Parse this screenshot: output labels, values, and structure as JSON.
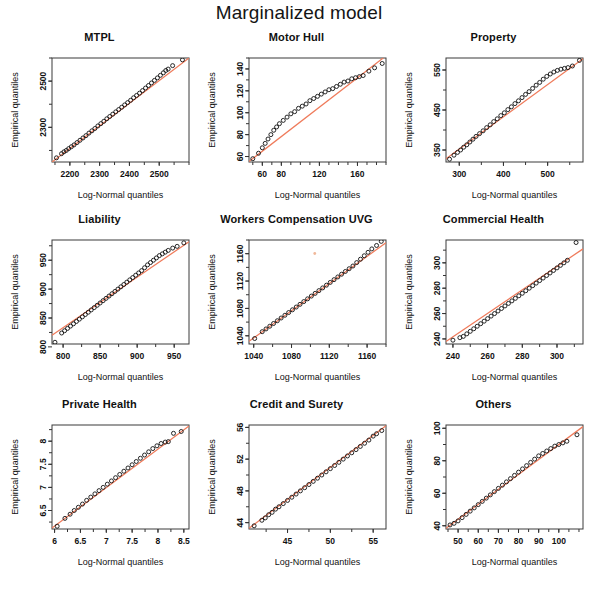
{
  "figure": {
    "title": "Marginalized model",
    "xlabel": "Log-Normal quantiles",
    "ylabel": "Empirical quantiles",
    "line_color": "#ef7b5b",
    "point_color": "#111111",
    "background": "#ffffff"
  },
  "chart_data": [
    {
      "type": "scatter",
      "title": "MTPL",
      "xlabel": "Log-Normal quantiles",
      "ylabel": "Empirical quantiles",
      "xlim": [
        2140,
        2600
      ],
      "ylim": [
        2150,
        2600
      ],
      "xticks": [
        2200,
        2300,
        2400,
        2500
      ],
      "yticks": [
        2300,
        2500
      ],
      "grid": false,
      "reference_line": {
        "from": [
          2140,
          2150
        ],
        "to": [
          2600,
          2600
        ]
      },
      "x": [
        2155,
        2172,
        2180,
        2188,
        2196,
        2205,
        2214,
        2224,
        2234,
        2244,
        2254,
        2264,
        2274,
        2284,
        2294,
        2304,
        2314,
        2324,
        2334,
        2344,
        2354,
        2364,
        2374,
        2384,
        2394,
        2404,
        2414,
        2424,
        2434,
        2444,
        2454,
        2464,
        2474,
        2484,
        2494,
        2504,
        2514,
        2522,
        2530,
        2545,
        2578
      ],
      "y": [
        2168,
        2186,
        2194,
        2200,
        2208,
        2216,
        2224,
        2234,
        2244,
        2254,
        2264,
        2275,
        2285,
        2295,
        2306,
        2316,
        2326,
        2337,
        2347,
        2357,
        2367,
        2377,
        2387,
        2397,
        2407,
        2417,
        2428,
        2438,
        2448,
        2459,
        2470,
        2481,
        2492,
        2503,
        2514,
        2525,
        2536,
        2546,
        2552,
        2567,
        2592
      ]
    },
    {
      "type": "scatter",
      "title": "Motor Hull",
      "xlabel": "Log-Normal quantiles",
      "ylabel": "Empirical quantiles",
      "xlim": [
        46,
        190
      ],
      "ylim": [
        55,
        150
      ],
      "xticks": [
        60,
        80,
        120,
        160
      ],
      "yticks": [
        60,
        80,
        100,
        120,
        140
      ],
      "grid": false,
      "reference_line": {
        "from": [
          46,
          55.5
        ],
        "to": [
          190,
          152
        ]
      },
      "x": [
        50,
        56,
        60,
        63,
        66,
        69,
        72,
        75,
        78,
        82,
        86,
        90,
        94,
        98,
        102,
        106,
        110,
        114,
        118,
        122,
        126,
        130,
        134,
        138,
        142,
        146,
        150,
        154,
        158,
        162,
        166,
        172,
        178,
        186
      ],
      "y": [
        58,
        63,
        68,
        72,
        76,
        80,
        84,
        87,
        90,
        93,
        96,
        99,
        101,
        104,
        106,
        108,
        111,
        113,
        115,
        117,
        119,
        121,
        122,
        124,
        126,
        128,
        129,
        131,
        132,
        133,
        134,
        138,
        141,
        145
      ]
    },
    {
      "type": "scatter",
      "title": "Property",
      "xlabel": "Log-Normal quantiles",
      "ylabel": "Empirical quantiles",
      "xlim": [
        270,
        580
      ],
      "ylim": [
        320,
        580
      ],
      "xticks": [
        300,
        400,
        500
      ],
      "yticks": [
        350,
        450,
        550
      ],
      "grid": false,
      "reference_line": {
        "from": [
          270,
          328
        ],
        "to": [
          580,
          578
        ]
      },
      "x": [
        278,
        288,
        296,
        303,
        310,
        317,
        324,
        331,
        338,
        346,
        354,
        362,
        370,
        378,
        386,
        394,
        402,
        410,
        418,
        426,
        434,
        442,
        450,
        458,
        466,
        474,
        482,
        490,
        498,
        506,
        514,
        522,
        530,
        538,
        546,
        556,
        572
      ],
      "y": [
        327,
        337,
        344,
        350,
        357,
        363,
        370,
        377,
        384,
        391,
        398,
        406,
        413,
        421,
        428,
        436,
        443,
        451,
        458,
        466,
        473,
        481,
        489,
        496,
        504,
        512,
        519,
        527,
        534,
        540,
        545,
        549,
        552,
        554,
        556,
        560,
        574
      ]
    },
    {
      "type": "scatter",
      "title": "Liability",
      "xlabel": "Log-Normal quantiles",
      "ylabel": "Empirical quantiles",
      "xlim": [
        785,
        970
      ],
      "ylim": [
        805,
        985
      ],
      "xticks": [
        800,
        850,
        900,
        950
      ],
      "yticks": [
        800,
        850,
        900,
        950
      ],
      "grid": false,
      "reference_line": {
        "from": [
          785,
          820
        ],
        "to": [
          970,
          982
        ]
      },
      "x": [
        789,
        798,
        802,
        806,
        810,
        814,
        818,
        822,
        826,
        830,
        834,
        838,
        842,
        846,
        850,
        854,
        858,
        862,
        866,
        870,
        874,
        878,
        882,
        886,
        890,
        894,
        898,
        902,
        906,
        910,
        914,
        918,
        922,
        926,
        930,
        934,
        938,
        942,
        948,
        954,
        963
      ],
      "y": [
        808,
        824,
        828,
        832,
        836,
        840,
        844,
        848,
        852,
        856,
        860,
        864,
        868,
        872,
        876,
        880,
        884,
        888,
        892,
        896,
        900,
        904,
        908,
        912,
        916,
        920,
        924,
        928,
        932,
        937,
        942,
        946,
        950,
        954,
        958,
        961,
        964,
        967,
        971,
        974,
        980
      ]
    },
    {
      "type": "scatter",
      "title": "Workers Compensation UVG",
      "xlabel": "Log-Normal quantiles",
      "ylabel": "Empirical quantiles",
      "xlim": [
        1035,
        1180
      ],
      "ylim": [
        1028,
        1180
      ],
      "xticks": [
        1040,
        1080,
        1120,
        1160
      ],
      "yticks": [
        1040,
        1080,
        1120,
        1160
      ],
      "grid": false,
      "reference_line": {
        "from": [
          1035,
          1032
        ],
        "to": [
          1180,
          1176
        ]
      },
      "x": [
        1041,
        1049,
        1053,
        1057,
        1061,
        1065,
        1069,
        1073,
        1077,
        1081,
        1085,
        1089,
        1093,
        1097,
        1101,
        1105,
        1109,
        1113,
        1117,
        1121,
        1125,
        1129,
        1133,
        1137,
        1141,
        1145,
        1149,
        1153,
        1157,
        1161,
        1165,
        1170,
        1175
      ],
      "y": [
        1036,
        1046,
        1050,
        1054,
        1058,
        1062,
        1066,
        1070,
        1074,
        1078,
        1082,
        1086,
        1090,
        1094,
        1098,
        1102,
        1106,
        1110,
        1114,
        1118,
        1122,
        1126,
        1130,
        1134,
        1138,
        1142,
        1147,
        1152,
        1157,
        1162,
        1167,
        1172,
        1178
      ]
    },
    {
      "type": "scatter",
      "title": "Commercial Health",
      "xlabel": "Log-Normal quantiles",
      "ylabel": "Empirical quantiles",
      "xlim": [
        236,
        315
      ],
      "ylim": [
        236,
        318
      ],
      "xticks": [
        240,
        260,
        280,
        300
      ],
      "yticks": [
        240,
        260,
        280,
        300
      ],
      "grid": false,
      "reference_line": {
        "from": [
          236,
          238
        ],
        "to": [
          315,
          311
        ]
      },
      "x": [
        240,
        244,
        246,
        248,
        250,
        252,
        254,
        256,
        258,
        260,
        262,
        264,
        266,
        268,
        270,
        272,
        274,
        276,
        278,
        280,
        282,
        284,
        286,
        288,
        290,
        292,
        294,
        296,
        298,
        300,
        302,
        304,
        306,
        311
      ],
      "y": [
        239,
        241,
        242,
        244,
        246,
        248,
        250,
        252,
        254,
        256,
        258,
        260,
        262,
        264,
        266,
        268,
        270,
        272,
        274,
        276,
        278,
        280,
        282,
        284,
        286,
        288,
        290,
        292,
        294,
        296,
        298,
        300,
        302,
        316
      ]
    },
    {
      "type": "scatter",
      "title": "Private Health",
      "xlabel": "Log-Normal quantiles",
      "ylabel": "Empirical quantiles",
      "xlim": [
        5.95,
        8.6
      ],
      "ylim": [
        6.1,
        8.35
      ],
      "xticks": [
        6.0,
        6.5,
        7.0,
        7.5,
        8.0,
        8.5
      ],
      "yticks": [
        6.5,
        7.0,
        7.5,
        8.0
      ],
      "grid": false,
      "reference_line": {
        "from": [
          5.95,
          6.12
        ],
        "to": [
          8.6,
          8.33
        ]
      },
      "x": [
        6.05,
        6.2,
        6.3,
        6.38,
        6.46,
        6.54,
        6.62,
        6.7,
        6.78,
        6.86,
        6.94,
        7.02,
        7.1,
        7.18,
        7.26,
        7.34,
        7.42,
        7.5,
        7.58,
        7.66,
        7.74,
        7.82,
        7.9,
        7.98,
        8.06,
        8.14,
        8.2,
        8.3,
        8.45
      ],
      "y": [
        6.16,
        6.33,
        6.42,
        6.5,
        6.57,
        6.64,
        6.72,
        6.79,
        6.86,
        6.93,
        7.0,
        7.07,
        7.14,
        7.21,
        7.28,
        7.35,
        7.42,
        7.49,
        7.56,
        7.63,
        7.7,
        7.77,
        7.84,
        7.9,
        7.95,
        7.98,
        7.99,
        8.17,
        8.21
      ]
    },
    {
      "type": "scatter",
      "title": "Credit and Surety",
      "xlabel": "Log-Normal quantiles",
      "ylabel": "Empirical quantiles",
      "xlim": [
        40.5,
        56.5
      ],
      "ylim": [
        43.2,
        56.3
      ],
      "xticks": [
        45,
        50,
        55
      ],
      "yticks": [
        44,
        48,
        52,
        56
      ],
      "grid": false,
      "reference_line": {
        "from": [
          40.5,
          43.3
        ],
        "to": [
          56.5,
          56.2
        ]
      },
      "x": [
        41.1,
        42.0,
        42.4,
        42.8,
        43.2,
        43.6,
        44.0,
        44.5,
        45.0,
        45.5,
        46.0,
        46.5,
        47.0,
        47.5,
        48.0,
        48.5,
        49.0,
        49.5,
        50.0,
        50.5,
        51.0,
        51.5,
        52.0,
        52.5,
        53.0,
        53.5,
        54.0,
        54.5,
        55.0,
        55.4,
        56.0
      ],
      "y": [
        43.6,
        44.3,
        44.6,
        45.0,
        45.3,
        45.7,
        46.0,
        46.4,
        46.8,
        47.2,
        47.6,
        48.0,
        48.4,
        48.8,
        49.2,
        49.6,
        50.0,
        50.4,
        50.8,
        51.2,
        51.6,
        52.0,
        52.4,
        52.8,
        53.2,
        53.6,
        54.0,
        54.4,
        54.9,
        55.2,
        55.6
      ]
    },
    {
      "type": "scatter",
      "title": "Others",
      "xlabel": "Log-Normal quantiles",
      "ylabel": "Empirical quantiles",
      "xlim": [
        44,
        112
      ],
      "ylim": [
        38,
        102
      ],
      "xticks": [
        50,
        60,
        70,
        80,
        90,
        100
      ],
      "yticks": [
        40,
        60,
        80,
        100
      ],
      "grid": false,
      "reference_line": {
        "from": [
          44,
          38.5
        ],
        "to": [
          112,
          101
        ]
      },
      "x": [
        46,
        48,
        50,
        52,
        54,
        56,
        58,
        60,
        62,
        64,
        66,
        68,
        70,
        72,
        74,
        76,
        78,
        80,
        82,
        84,
        86,
        88,
        90,
        92,
        94,
        96,
        98,
        100,
        102,
        104,
        109
      ],
      "y": [
        40.5,
        41.5,
        43,
        45,
        47,
        49,
        51,
        53,
        55,
        57,
        59,
        61,
        63,
        65,
        67,
        69,
        71,
        73,
        75,
        77,
        79,
        81,
        83,
        84.5,
        86,
        87.5,
        89,
        90,
        91,
        92,
        96
      ]
    }
  ],
  "artifact": {
    "panel_index": 4,
    "x_frac": 0.48,
    "y_frac": 0.13,
    "color": "#f0b89a"
  }
}
